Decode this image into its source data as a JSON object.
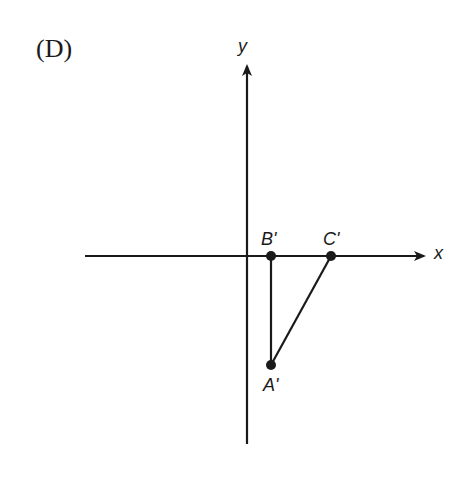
{
  "panel_label": "(D)",
  "axes": {
    "x_label": "x",
    "y_label": "y"
  },
  "points": {
    "A": {
      "label": "A'",
      "px": [
        271,
        365
      ]
    },
    "B": {
      "label": "B'",
      "px": [
        271,
        256
      ]
    },
    "C": {
      "label": "C'",
      "px": [
        331,
        256
      ]
    }
  },
  "colors": {
    "stroke": "#1a1a1a",
    "background": "#ffffff"
  }
}
